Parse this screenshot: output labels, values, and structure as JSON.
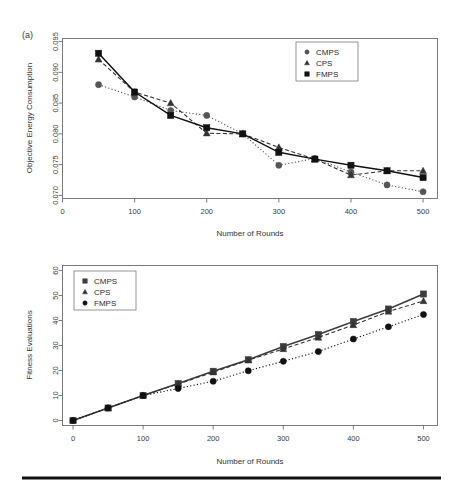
{
  "figure": {
    "panel_label": "(a)",
    "background": "#ffffff",
    "rule_color": "#111111"
  },
  "chart_data": [
    {
      "id": "top",
      "type": "line",
      "title": "",
      "panel_label": "(a)",
      "xlabel": "Number of Rounds",
      "ylabel": "Objective Energy Consumption",
      "xlim": [
        0,
        520
      ],
      "ylim": [
        0.0695,
        0.0955
      ],
      "xticks": [
        0,
        100,
        200,
        300,
        400,
        500
      ],
      "xticklabels": [
        "0",
        "100",
        "200",
        "300",
        "400",
        "500"
      ],
      "yticks": [
        0.07,
        0.075,
        0.08,
        0.085,
        0.09,
        0.095
      ],
      "yticklabels": [
        "0.070",
        "0.075",
        "0.080",
        "0.085",
        "0.090",
        "0.095"
      ],
      "grid": false,
      "legend_position": "top-right",
      "x": [
        50,
        100,
        150,
        200,
        250,
        300,
        350,
        400,
        450,
        500
      ],
      "series": [
        {
          "name": "CMPS",
          "marker": "circle",
          "linestyle": "dotted",
          "color": "#555555",
          "values": [
            0.088,
            0.086,
            0.0838,
            0.083,
            0.08,
            0.0749,
            0.076,
            0.0738,
            0.0717,
            0.0706
          ]
        },
        {
          "name": "CPS",
          "marker": "triangle",
          "linestyle": "dashed",
          "color": "#333333",
          "values": [
            0.0921,
            0.0868,
            0.085,
            0.0801,
            0.08,
            0.0778,
            0.0759,
            0.0733,
            0.074,
            0.074
          ]
        },
        {
          "name": "FMPS",
          "marker": "square",
          "linestyle": "solid",
          "color": "#111111",
          "values": [
            0.0931,
            0.0868,
            0.083,
            0.081,
            0.08,
            0.077,
            0.0759,
            0.0749,
            0.074,
            0.0729
          ]
        }
      ]
    },
    {
      "id": "bottom",
      "type": "line",
      "title": "",
      "panel_label": "",
      "xlabel": "Number of Rounds",
      "ylabel": "Fitness Evaluations",
      "xlim": [
        -15,
        520
      ],
      "ylim": [
        -2,
        62
      ],
      "xticks": [
        0,
        100,
        200,
        300,
        400,
        500
      ],
      "xticklabels": [
        "0",
        "100",
        "200",
        "300",
        "400",
        "500"
      ],
      "yticks": [
        0,
        10,
        20,
        30,
        40,
        50,
        60
      ],
      "yticklabels": [
        "0",
        "10",
        "20",
        "30",
        "40",
        "50",
        "60"
      ],
      "grid": false,
      "legend_position": "top-left",
      "x": [
        0,
        50,
        100,
        150,
        200,
        250,
        300,
        350,
        400,
        450,
        500
      ],
      "series": [
        {
          "name": "CMPS",
          "marker": "square",
          "linestyle": "solid",
          "color": "#3d3d3d",
          "values": [
            0,
            5,
            10,
            14.8,
            19.7,
            24.3,
            29.6,
            34.4,
            39.6,
            44.6,
            50.6
          ]
        },
        {
          "name": "CPS",
          "marker": "triangle",
          "linestyle": "dashed",
          "color": "#333333",
          "values": [
            0,
            5,
            10,
            14.6,
            19.3,
            24.1,
            28.6,
            33.2,
            38.2,
            43.6,
            47.8
          ]
        },
        {
          "name": "FMPS",
          "marker": "circle",
          "linestyle": "dotted",
          "color": "#111111",
          "values": [
            0,
            5,
            10,
            12.8,
            15.7,
            19.9,
            23.7,
            27.6,
            32.6,
            37.5,
            42.4
          ]
        }
      ]
    }
  ]
}
